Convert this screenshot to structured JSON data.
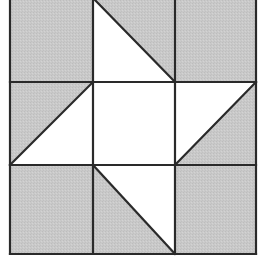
{
  "diagram": {
    "type": "quilt-block",
    "grid": {
      "rows": 3,
      "cols": 3
    },
    "colors": {
      "shaded": "#c9c9c9",
      "light": "#ffffff",
      "line": "#2a2a2a",
      "background": "#ffffff"
    },
    "geometry": {
      "x_lines": [
        10,
        93,
        175,
        256
      ],
      "y_lines": [
        -2,
        82,
        165,
        254
      ],
      "stroke_width": 2.2
    },
    "cells": [
      {
        "row": 0,
        "col": 0,
        "kind": "solid",
        "fill": "shaded"
      },
      {
        "row": 0,
        "col": 1,
        "kind": "half-square",
        "diagonal": "tl-br",
        "light_half": "lower-left",
        "shaded_half": "upper-right"
      },
      {
        "row": 0,
        "col": 2,
        "kind": "solid",
        "fill": "shaded"
      },
      {
        "row": 1,
        "col": 0,
        "kind": "half-square",
        "diagonal": "tr-bl",
        "light_half": "lower-right",
        "shaded_half": "upper-left"
      },
      {
        "row": 1,
        "col": 1,
        "kind": "solid",
        "fill": "light"
      },
      {
        "row": 1,
        "col": 2,
        "kind": "half-square",
        "diagonal": "tr-bl",
        "light_half": "upper-left",
        "shaded_half": "lower-right"
      },
      {
        "row": 2,
        "col": 0,
        "kind": "solid",
        "fill": "shaded"
      },
      {
        "row": 2,
        "col": 1,
        "kind": "half-square",
        "diagonal": "tl-br",
        "light_half": "upper-right",
        "shaded_half": "lower-left"
      },
      {
        "row": 2,
        "col": 2,
        "kind": "solid",
        "fill": "shaded"
      }
    ]
  }
}
